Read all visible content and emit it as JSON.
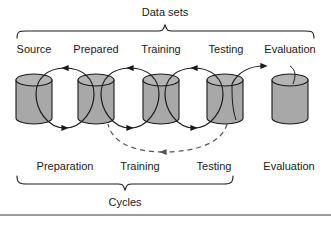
{
  "diagram": {
    "colors": {
      "cylinder_fill": "#a8a8a8",
      "cylinder_top_fill": "#b4b4b4",
      "stroke": "#1a1a1a",
      "background": "#ffffff",
      "rule": "#7a7a7a"
    },
    "top_group": {
      "label": "Data sets",
      "brace_left_x": 17,
      "brace_right_x": 314,
      "brace_center_x": 165
    },
    "bottom_group": {
      "label": "Cycles",
      "brace_left_x": 17,
      "brace_right_x": 233,
      "brace_center_x": 125
    },
    "datasets": [
      {
        "label": "Source",
        "cx": 34,
        "top_label_x": 34
      },
      {
        "label": "Prepared",
        "cx": 96,
        "top_label_x": 96
      },
      {
        "label": "Training",
        "cx": 161,
        "top_label_x": 161
      },
      {
        "label": "Testing",
        "cx": 225,
        "top_label_x": 225
      },
      {
        "label": "Evaluation",
        "cx": 290,
        "top_label_x": 290
      }
    ],
    "cycles": [
      {
        "label": "Preparation",
        "cx": 65,
        "type": "solid-loop"
      },
      {
        "label": "Training",
        "cx": 140,
        "type": "solid-loop"
      },
      {
        "label": "Testing",
        "cx": 214,
        "type": "solid-loop"
      },
      {
        "label": "Evaluation",
        "cx": 289,
        "type": "none"
      }
    ],
    "loops": [
      {
        "from": "Source",
        "to": "Prepared",
        "style": "solid",
        "cx": 65,
        "direction": "clockwise"
      },
      {
        "from": "Prepared",
        "to": "Training",
        "style": "solid",
        "cx": 130,
        "direction": "clockwise"
      },
      {
        "from": "Training",
        "to": "Testing",
        "style": "solid",
        "cx": 193,
        "direction": "clockwise"
      },
      {
        "from": "Testing",
        "to": "Evaluation",
        "style": "arrow",
        "cx": 258,
        "direction": "right"
      }
    ],
    "feedback_arrow": {
      "style": "dashed",
      "from": "Testing",
      "to": "Prepared",
      "direction": "leftward",
      "label": ""
    },
    "footer_rule": {
      "y": 215
    }
  }
}
